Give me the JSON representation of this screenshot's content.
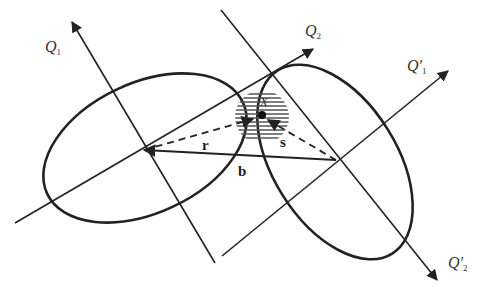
{
  "diagram": {
    "type": "two-ellipse-frames-with-baseline",
    "labels": {
      "q1": {
        "main": "Q",
        "sub": "1",
        "prime": ""
      },
      "q2": {
        "main": "Q",
        "sub": "2",
        "prime": ""
      },
      "q1p": {
        "main": "Q",
        "sub": "1",
        "prime": "′"
      },
      "q2p": {
        "main": "Q",
        "sub": "2",
        "prime": "′"
      },
      "x": "X",
      "r": "r",
      "s": "s",
      "b": "b"
    },
    "colors": {
      "line": "#222222",
      "hatch": "#555555",
      "background": "#ffffff"
    }
  }
}
